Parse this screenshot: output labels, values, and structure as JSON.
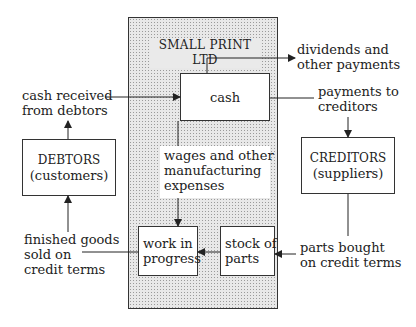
{
  "diagram": {
    "company": {
      "title": "SMALL PRINT LTD"
    },
    "nodes": {
      "cash": {
        "label": "cash"
      },
      "wages": {
        "line1": "wages and other",
        "line2": "manufacturing",
        "line3": "expenses"
      },
      "work_in_progress": {
        "line1": "work in",
        "line2": "progress"
      },
      "stock_of_parts": {
        "line1": "stock of",
        "line2": "parts"
      },
      "debtors": {
        "line1": "DEBTORS",
        "line2": "(customers)"
      },
      "creditors": {
        "line1": "CREDITORS",
        "line2": "(suppliers)"
      }
    },
    "flows": {
      "cash_received": {
        "line1": "cash received",
        "line2": "from debtors"
      },
      "dividends": {
        "line1": "dividends and",
        "line2": "other payments"
      },
      "payments_creditors": {
        "line1": "payments to",
        "line2": "creditors"
      },
      "finished_goods": {
        "line1": "finished goods",
        "line2": "sold on",
        "line3": "credit terms"
      },
      "parts_bought": {
        "line1": "parts bought",
        "line2": "on credit terms"
      }
    },
    "colors": {
      "line": "#222222",
      "shade": "#e8e8e8",
      "dots": "#9a9a9a"
    }
  }
}
